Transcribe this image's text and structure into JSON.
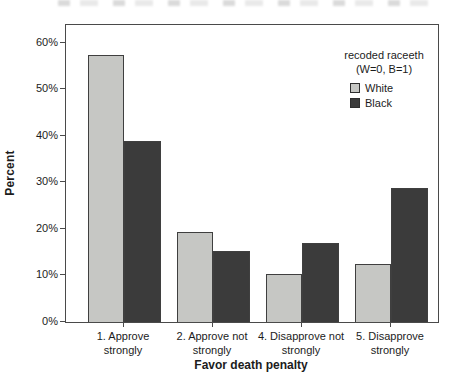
{
  "chart_data": {
    "type": "bar",
    "categories": [
      "1. Approve\nstrongly",
      "2. Approve not\nstrongly",
      "4. Disapprove not\nstrongly",
      "5. Disapprove\nstrongly"
    ],
    "series": [
      {
        "name": "White",
        "values": [
          57.3,
          19.3,
          10.3,
          12.4
        ],
        "color": "#c6c7c4"
      },
      {
        "name": "Black",
        "values": [
          38.8,
          15.2,
          17.0,
          28.7
        ],
        "color": "#3b3b3b"
      }
    ],
    "title": "",
    "xlabel": "Favor death penalty",
    "ylabel": "Percent",
    "ylim": [
      0,
      63.8
    ],
    "ytick_values": [
      0,
      10,
      20,
      30,
      40,
      50,
      60
    ],
    "ytick_labels": [
      "0%",
      "10%",
      "20%",
      "30%",
      "40%",
      "50%",
      "60%"
    ],
    "grid": false,
    "legend": {
      "title": "recoded raceeth",
      "subtitle": "(W=0, B=1)",
      "position": "top-right",
      "entries": [
        "White",
        "Black"
      ]
    }
  },
  "colors": {
    "white_bar": "#c6c7c4",
    "black_bar": "#3b3b3b",
    "frame": "#4a4a4a",
    "text": "#1c1c1c",
    "background": "#ffffff"
  }
}
